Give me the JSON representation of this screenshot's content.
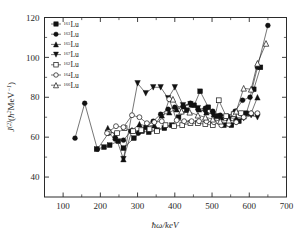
{
  "chart_data": {
    "type": "line",
    "title": "",
    "xlabel": "ħω/keV",
    "ylabel": "J(2)(ħ2MeV-1)",
    "xlim": [
      50,
      700
    ],
    "ylim": [
      30,
      120
    ],
    "grid": false,
    "legend_position": "top-left",
    "xticks": [
      100,
      200,
      300,
      400,
      500,
      600,
      700
    ],
    "yticks": [
      40,
      60,
      80,
      100,
      120
    ],
    "series": [
      {
        "name": "161Lu",
        "mass": "161",
        "element": "Lu",
        "marker": "filled-square",
        "x": [
          190,
          210,
          225,
          248,
          262,
          290,
          312,
          330,
          352,
          372,
          392,
          410,
          432,
          452,
          468,
          490,
          512,
          532,
          552,
          572,
          592,
          612,
          630
        ],
        "y": [
          54,
          55,
          56,
          58,
          54.5,
          59.5,
          63,
          62.5,
          63.5,
          64.5,
          66,
          70,
          73.5,
          76,
          83,
          75,
          70.5,
          66,
          66,
          68,
          72,
          84,
          95
        ]
      },
      {
        "name": "163Lu",
        "mass": "163",
        "element": "Lu",
        "marker": "filled-circle",
        "x": [
          132,
          158,
          192,
          222,
          240,
          262,
          282,
          302,
          322,
          342,
          362,
          382,
          400,
          422,
          442,
          462,
          482,
          502,
          522,
          542,
          562,
          582,
          602,
          622,
          650
        ],
        "y": [
          59.5,
          77,
          54,
          62,
          59,
          58.5,
          63,
          62,
          65,
          68,
          71.5,
          74,
          75,
          75.5,
          77,
          74,
          74.5,
          73,
          71,
          70.5,
          73,
          78.5,
          80,
          95,
          116
        ]
      },
      {
        "name": "165Lu",
        "mass": "165",
        "element": "Lu",
        "marker": "filled-triangle-up",
        "x": [
          220,
          240,
          262,
          285,
          305,
          325,
          345,
          365,
          385,
          405,
          425,
          445,
          465,
          485,
          505,
          525,
          545,
          565,
          585,
          605,
          622
        ],
        "y": [
          64.5,
          61,
          49,
          63.5,
          66.5,
          65.5,
          66,
          71,
          72.5,
          74,
          75.5,
          76.5,
          74,
          72.5,
          71.5,
          70,
          69.5,
          69.5,
          70.5,
          72,
          80
        ]
      },
      {
        "name": "167Lu",
        "mass": "167",
        "element": "Lu",
        "marker": "filled-triangle-down",
        "x": [
          262,
          300,
          322,
          342,
          362,
          382,
          400,
          422,
          442,
          462,
          482,
          502,
          522,
          545,
          565,
          585,
          605,
          622
        ],
        "y": [
          49,
          87,
          82,
          85,
          85,
          79.5,
          85,
          76,
          76.5,
          74.5,
          72.5,
          71.5,
          70,
          69,
          67.5,
          69.5,
          71,
          70
        ]
      },
      {
        "name": "162Lu",
        "mass": "162",
        "element": "Lu",
        "marker": "open-square",
        "x": [
          222,
          245,
          265,
          288,
          310,
          332,
          352,
          375,
          398,
          420,
          442,
          462,
          482,
          502,
          518,
          538,
          558,
          578
        ],
        "y": [
          62.5,
          62,
          64.5,
          63,
          63.5,
          64,
          63,
          66,
          65.5,
          66,
          67,
          67,
          66.5,
          66,
          78.5,
          70.5,
          71.5,
          72
        ]
      },
      {
        "name": "164Lu",
        "mass": "164",
        "element": "Lu",
        "marker": "open-circle",
        "x": [
          218,
          242,
          262,
          285,
          305,
          325,
          345,
          365,
          385,
          405,
          425,
          445,
          465,
          485,
          505,
          525,
          545,
          565,
          585,
          605,
          622
        ],
        "y": [
          62,
          65.5,
          65,
          71,
          70,
          67,
          67.5,
          68,
          79,
          68.5,
          68,
          68,
          68,
          68,
          67.5,
          66,
          66.5,
          67.5,
          70,
          72,
          72
        ]
      },
      {
        "name": "166Lu",
        "mass": "166",
        "element": "Lu",
        "marker": "open-triangle-up",
        "x": [
          395,
          418,
          440,
          462,
          482,
          502,
          522,
          545,
          565,
          585,
          605,
          622,
          645
        ],
        "y": [
          79,
          73,
          72.5,
          71,
          70,
          69,
          68,
          68.5,
          73,
          84.5,
          84,
          97,
          107
        ]
      }
    ]
  },
  "legend": {
    "entries": [
      {
        "mass": "161",
        "element": "Lu",
        "marker": "filled-square"
      },
      {
        "mass": "163",
        "element": "Lu",
        "marker": "filled-circle"
      },
      {
        "mass": "165",
        "element": "Lu",
        "marker": "filled-triangle-up"
      },
      {
        "mass": "167",
        "element": "Lu",
        "marker": "filled-triangle-down"
      },
      {
        "mass": "162",
        "element": "Lu",
        "marker": "open-square"
      },
      {
        "mass": "164",
        "element": "Lu",
        "marker": "open-circle"
      },
      {
        "mass": "166",
        "element": "Lu",
        "marker": "open-triangle-up"
      }
    ]
  },
  "axes": {
    "x_title": "ħω/keV",
    "y_title_main": "J",
    "y_title_sup": "(2)",
    "y_title_unit": "(ħ",
    "y_title_unit_sup": "2",
    "y_title_unit_rest": "MeV",
    "y_title_unit_sup2": "−1",
    "y_title_close": ")"
  }
}
